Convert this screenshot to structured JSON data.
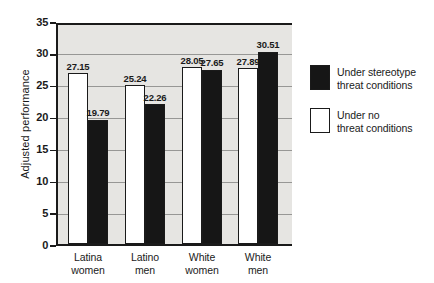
{
  "chart_data": {
    "type": "bar",
    "title": "",
    "xlabel": "",
    "ylabel": "Adjusted performance",
    "ylim": [
      0,
      35
    ],
    "yticks": [
      0,
      5,
      10,
      15,
      20,
      25,
      30,
      35
    ],
    "grid": true,
    "legend_position": "right",
    "bar_value_labels": true,
    "categories": [
      [
        "Latina",
        "women"
      ],
      [
        "Latino",
        "men"
      ],
      [
        "White",
        "women"
      ],
      [
        "White",
        "men"
      ]
    ],
    "series": [
      {
        "id": "no_threat",
        "name": "Under no threat conditions",
        "fill": "#ffffff",
        "values": [
          27.15,
          25.24,
          28.05,
          27.89
        ]
      },
      {
        "id": "threat",
        "name": "Under stereotype threat conditions",
        "fill": "#161616",
        "values": [
          19.79,
          22.26,
          27.65,
          30.51
        ]
      }
    ],
    "legend": [
      {
        "series": "threat",
        "lines": [
          "Under stereotype",
          "threat conditions"
        ]
      },
      {
        "series": "no_threat",
        "lines": [
          "Under no",
          "threat conditions"
        ]
      }
    ],
    "colors": {
      "plot_background": "#e6e5e2",
      "gridline": "#979795",
      "axis": "#1a1a1a",
      "text": "#1a1a1a"
    }
  }
}
